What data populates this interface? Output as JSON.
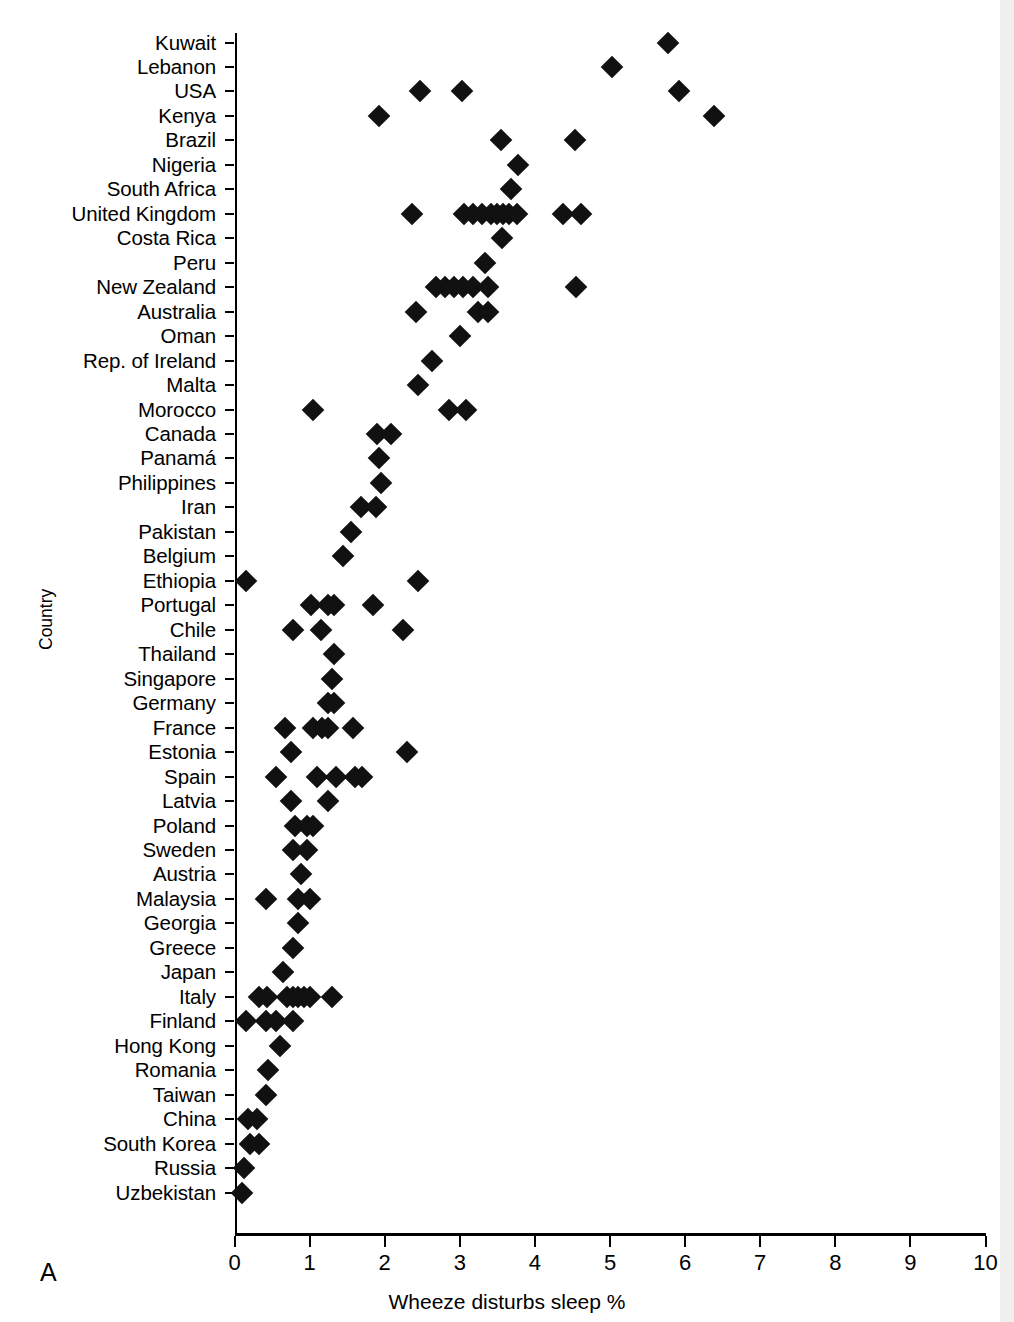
{
  "panel": {
    "letter": "A"
  },
  "axes": {
    "y_title": "Country",
    "x_title": "Wheeze disturbs sleep %",
    "x_ticks": [
      "0",
      "1",
      "2",
      "3",
      "4",
      "5",
      "6",
      "7",
      "8",
      "9",
      "10"
    ],
    "x_min": 0,
    "x_max": 10
  },
  "chart_data": {
    "type": "scatter",
    "title": "",
    "xlabel": "Wheeze disturbs sleep %",
    "ylabel": "Country",
    "xlim": [
      0,
      10
    ],
    "grid": false,
    "legend": "none",
    "marker": "filled-diamond",
    "marker_color": "#111111",
    "orientation": "horizontal",
    "note": "Each country row shows one point per participating study centre.",
    "categories": [
      "Kuwait",
      "Lebanon",
      "USA",
      "Kenya",
      "Brazil",
      "Nigeria",
      "South Africa",
      "United Kingdom",
      "Costa Rica",
      "Peru",
      "New Zealand",
      "Australia",
      "Oman",
      "Rep. of Ireland",
      "Malta",
      "Morocco",
      "Canada",
      "Panamá",
      "Philippines",
      "Iran",
      "Pakistan",
      "Belgium",
      "Ethiopia",
      "Portugal",
      "Chile",
      "Thailand",
      "Singapore",
      "Germany",
      "France",
      "Estonia",
      "Spain",
      "Latvia",
      "Poland",
      "Sweden",
      "Austria",
      "Malaysia",
      "Georgia",
      "Greece",
      "Japan",
      "Italy",
      "Finland",
      "Hong Kong",
      "Romania",
      "Taiwan",
      "China",
      "South Korea",
      "Russia",
      "Uzbekistan"
    ],
    "points": [
      {
        "country": "Kuwait",
        "values": [
          5.77
        ]
      },
      {
        "country": "Lebanon",
        "values": [
          5.02
        ]
      },
      {
        "country": "USA",
        "values": [
          2.47,
          3.03,
          5.92
        ]
      },
      {
        "country": "Kenya",
        "values": [
          1.93,
          6.38
        ]
      },
      {
        "country": "Brazil",
        "values": [
          3.55,
          4.53
        ]
      },
      {
        "country": "Nigeria",
        "values": [
          3.78
        ]
      },
      {
        "country": "South Africa",
        "values": [
          3.68
        ]
      },
      {
        "country": "United Kingdom",
        "values": [
          2.37,
          3.05,
          3.18,
          3.3,
          3.42,
          3.5,
          3.58,
          3.66,
          3.76,
          4.38,
          4.62
        ]
      },
      {
        "country": "Costa Rica",
        "values": [
          3.56
        ]
      },
      {
        "country": "Peru",
        "values": [
          3.33
        ]
      },
      {
        "country": "New Zealand",
        "values": [
          2.68,
          2.8,
          2.92,
          3.04,
          3.18,
          3.38,
          4.55
        ]
      },
      {
        "country": "Australia",
        "values": [
          2.42,
          3.24,
          3.38
        ]
      },
      {
        "country": "Oman",
        "values": [
          3.0
        ]
      },
      {
        "country": "Rep. of Ireland",
        "values": [
          2.63
        ]
      },
      {
        "country": "Malta",
        "values": [
          2.45
        ]
      },
      {
        "country": "Morocco",
        "values": [
          1.05,
          2.85,
          3.08
        ]
      },
      {
        "country": "Canada",
        "values": [
          1.9,
          2.08
        ]
      },
      {
        "country": "Panamá",
        "values": [
          1.92
        ]
      },
      {
        "country": "Philippines",
        "values": [
          1.95
        ]
      },
      {
        "country": "Iran",
        "values": [
          1.68,
          1.88
        ]
      },
      {
        "country": "Pakistan",
        "values": [
          1.55
        ]
      },
      {
        "country": "Belgium",
        "values": [
          1.45
        ]
      },
      {
        "country": "Ethiopia",
        "values": [
          0.15,
          2.45
        ]
      },
      {
        "country": "Portugal",
        "values": [
          1.02,
          1.25,
          1.33,
          1.85
        ]
      },
      {
        "country": "Chile",
        "values": [
          0.78,
          1.15,
          2.25
        ]
      },
      {
        "country": "Thailand",
        "values": [
          1.32
        ]
      },
      {
        "country": "Singapore",
        "values": [
          1.3
        ]
      },
      {
        "country": "Germany",
        "values": [
          1.25,
          1.33
        ]
      },
      {
        "country": "France",
        "values": [
          0.67,
          1.05,
          1.17,
          1.25,
          1.58
        ]
      },
      {
        "country": "Estonia",
        "values": [
          0.75,
          2.3
        ]
      },
      {
        "country": "Spain",
        "values": [
          0.55,
          1.1,
          1.35,
          1.6,
          1.7
        ]
      },
      {
        "country": "Latvia",
        "values": [
          0.75,
          1.25
        ]
      },
      {
        "country": "Poland",
        "values": [
          0.8,
          0.97,
          1.05
        ]
      },
      {
        "country": "Sweden",
        "values": [
          0.78,
          0.97
        ]
      },
      {
        "country": "Austria",
        "values": [
          0.88
        ]
      },
      {
        "country": "Malaysia",
        "values": [
          0.42,
          0.85,
          1.0
        ]
      },
      {
        "country": "Georgia",
        "values": [
          0.85
        ]
      },
      {
        "country": "Greece",
        "values": [
          0.78
        ]
      },
      {
        "country": "Japan",
        "values": [
          0.65
        ]
      },
      {
        "country": "Italy",
        "values": [
          0.33,
          0.43,
          0.7,
          0.78,
          0.85,
          0.92,
          1.0,
          1.3
        ]
      },
      {
        "country": "Finland",
        "values": [
          0.15,
          0.42,
          0.55,
          0.78
        ]
      },
      {
        "country": "Hong Kong",
        "values": [
          0.6
        ]
      },
      {
        "country": "Romania",
        "values": [
          0.45
        ]
      },
      {
        "country": "Taiwan",
        "values": [
          0.42
        ]
      },
      {
        "country": "China",
        "values": [
          0.18,
          0.3
        ]
      },
      {
        "country": "South Korea",
        "values": [
          0.2,
          0.32
        ]
      },
      {
        "country": "Russia",
        "values": [
          0.12
        ]
      },
      {
        "country": "Uzbekistan",
        "values": [
          0.1
        ]
      }
    ]
  }
}
